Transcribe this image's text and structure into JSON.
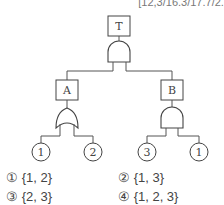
{
  "header_text": "[12,3/16.3/17.7/2...",
  "tree": {
    "top_event": {
      "label": "T",
      "gate": "AND"
    },
    "intermediate_events": [
      {
        "label": "A",
        "gate": "OR",
        "inputs": [
          "1",
          "2"
        ]
      },
      {
        "label": "B",
        "gate": "AND",
        "inputs": [
          "3",
          "1"
        ]
      }
    ],
    "basic_events": [
      "1",
      "2",
      "3",
      "1"
    ]
  },
  "options": [
    {
      "marker": "①",
      "text": "{1, 2}"
    },
    {
      "marker": "②",
      "text": "{1, 3}"
    },
    {
      "marker": "③",
      "text": "{2, 3}"
    },
    {
      "marker": "④",
      "text": "{1, 2, 3}"
    }
  ]
}
